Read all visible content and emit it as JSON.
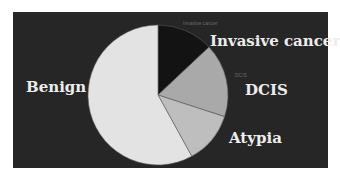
{
  "chart_data": {
    "type": "pie",
    "title": "",
    "start_angle_deg": 0,
    "direction": "clockwise",
    "categories": [
      "Invasive cancer",
      "DCIS",
      "Atypia",
      "Benign"
    ],
    "values": [
      13,
      17,
      12,
      58
    ],
    "unit": "%",
    "colors": [
      "#131313",
      "#a9a9a9",
      "#bebebe",
      "#e3e3e3"
    ],
    "legend": "none",
    "labels": {
      "outer": [
        "Invasive cancer",
        "DCIS",
        "Atypia",
        "Benign"
      ],
      "faint_small": [
        "Invasive cancer",
        "DCIS"
      ]
    }
  },
  "labels": {
    "invasive": "Invasive cancer",
    "invasive_small": "Invasive cancer",
    "dcis": "DCIS",
    "dcis_small": "DCIS",
    "atypia": "Atypia",
    "benign": "Benign"
  },
  "colors": {
    "background": "#262626",
    "outer": "#ffffff",
    "label_text": "#ededed",
    "slice_border": "#5a5a5a"
  }
}
